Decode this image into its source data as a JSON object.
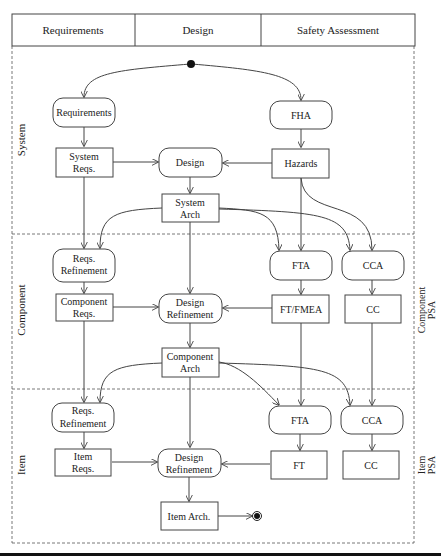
{
  "header": {
    "columns": [
      "Requirements",
      "Design",
      "Safety Assessment"
    ]
  },
  "swimlanes": {
    "left": [
      "System",
      "Component",
      "Item"
    ],
    "right": [
      {
        "line1": "Component",
        "line2": "PSA"
      },
      {
        "line1": "Item",
        "line2": "PSA"
      }
    ]
  },
  "nodes": {
    "system_requirements_activity": "Requirements",
    "system_fha": "FHA",
    "system_reqs_l1": "System",
    "system_reqs_l2": "Reqs.",
    "system_design": "Design",
    "system_hazards": "Hazards",
    "system_arch_l1": "System",
    "system_arch_l2": "Arch",
    "comp_reqs_ref_l1": "Reqs.",
    "comp_reqs_ref_l2": "Refinement",
    "comp_fta": "FTA",
    "comp_cca": "CCA",
    "comp_reqs_l1": "Component",
    "comp_reqs_l2": "Reqs.",
    "comp_design_ref_l1": "Design",
    "comp_design_ref_l2": "Refinement",
    "comp_ftfmea": "FT/FMEA",
    "comp_cc": "CC",
    "comp_arch_l1": "Component",
    "comp_arch_l2": "Arch",
    "item_reqs_ref_l1": "Reqs.",
    "item_reqs_ref_l2": "Refinement",
    "item_fta": "FTA",
    "item_cca": "CCA",
    "item_reqs_l1": "Item",
    "item_reqs_l2": "Reqs.",
    "item_design_ref_l1": "Design",
    "item_design_ref_l2": "Refinement",
    "item_ft": "FT",
    "item_cc": "CC",
    "item_arch": "Item Arch."
  }
}
